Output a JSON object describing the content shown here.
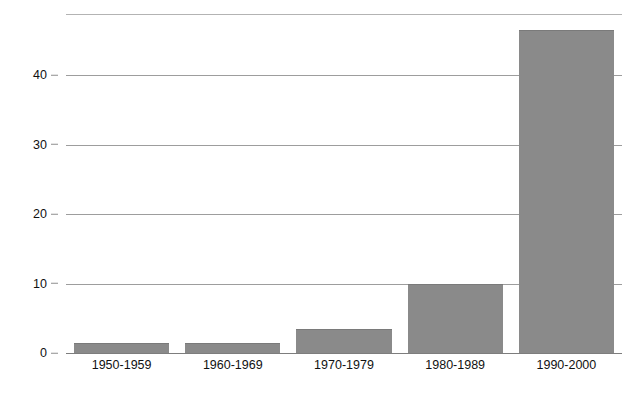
{
  "chart_data": {
    "type": "bar",
    "title": "",
    "subtitle": "",
    "xlabel": "",
    "ylabel": "Nombre de feux de forêts majeurs",
    "categories": [
      "1950-1959",
      "1960-1969",
      "1970-1979",
      "1980-1989",
      "1990-2000"
    ],
    "values": [
      1.4,
      1.4,
      3.5,
      10,
      46.5
    ],
    "series": [
      {
        "name": "Nombre de feux de forêts majeurs",
        "values": [
          1.4,
          1.4,
          3.5,
          10,
          46.5
        ]
      }
    ],
    "ylim": [
      0,
      48.8
    ],
    "yticks": [
      0,
      10,
      20,
      30,
      40
    ],
    "ytick_labels": [
      "0",
      "10",
      "20",
      "30",
      "40"
    ],
    "grid": true,
    "gridlines_horizontal": [
      0,
      10,
      20,
      30,
      40,
      48.8
    ],
    "legend": false,
    "legend_position": "none",
    "bar_color": "#8a8a8a",
    "grid_color": "#9d9d9d",
    "background_color": "#ffffff",
    "text_color": "#111111",
    "orientation": "vertical"
  },
  "axis": {
    "y_title": "Nombre de feux de forêts majeurs",
    "ticks": [
      {
        "label": "40",
        "value": 40
      },
      {
        "label": "30",
        "value": 30
      },
      {
        "label": "20",
        "value": 20
      },
      {
        "label": "10",
        "value": 10
      },
      {
        "label": "0",
        "value": 0
      }
    ]
  },
  "bars": [
    {
      "category": "1950-1959",
      "value": 1.4
    },
    {
      "category": "1960-1969",
      "value": 1.4
    },
    {
      "category": "1970-1979",
      "value": 3.5
    },
    {
      "category": "1980-1989",
      "value": 10
    },
    {
      "category": "1990-2000",
      "value": 46.5
    }
  ]
}
